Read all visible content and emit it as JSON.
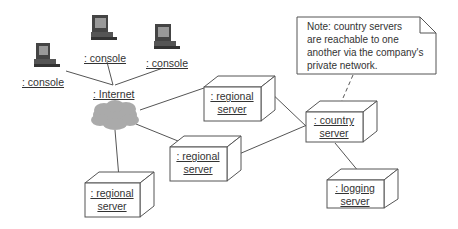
{
  "diagram": {
    "type": "UML deployment diagram",
    "nodes": [
      {
        "id": "console1",
        "kind": "computer",
        "label": ": console"
      },
      {
        "id": "console2",
        "kind": "computer",
        "label": ": console"
      },
      {
        "id": "console3",
        "kind": "computer",
        "label": ": console"
      },
      {
        "id": "internet",
        "kind": "cloud",
        "label": ": Internet"
      },
      {
        "id": "regional1",
        "kind": "node",
        "label_line1": ": regional",
        "label_line2": "server"
      },
      {
        "id": "regional2",
        "kind": "node",
        "label_line1": ": regional",
        "label_line2": "server"
      },
      {
        "id": "regional3",
        "kind": "node",
        "label_line1": ": regional",
        "label_line2": "server"
      },
      {
        "id": "country",
        "kind": "node",
        "label_line1": ": country",
        "label_line2": "server"
      },
      {
        "id": "logging",
        "kind": "node",
        "label_line1": ": logging",
        "label_line2": "server"
      }
    ],
    "edges": [
      [
        "console1",
        "internet"
      ],
      [
        "console2",
        "internet"
      ],
      [
        "console3",
        "internet"
      ],
      [
        "internet",
        "regional1"
      ],
      [
        "internet",
        "regional2"
      ],
      [
        "internet",
        "regional3"
      ],
      [
        "regional1",
        "country"
      ],
      [
        "regional2",
        "country"
      ],
      [
        "country",
        "logging"
      ]
    ],
    "note": {
      "lines": [
        "Note: country servers",
        "are reachable to one",
        "another via the company's",
        "private network."
      ],
      "attached_to": "country"
    }
  }
}
